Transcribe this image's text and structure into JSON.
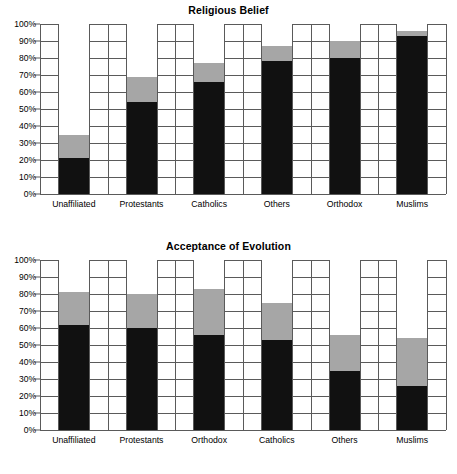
{
  "chart_data": [
    {
      "type": "bar",
      "subtype": "stacked-100",
      "title": "Religious Belief",
      "xlabel": "",
      "ylabel": "",
      "ylim": [
        0,
        100
      ],
      "ytick_labels": [
        "0%",
        "10%",
        "20%",
        "30%",
        "40%",
        "50%",
        "60%",
        "70%",
        "80%",
        "90%",
        "100%"
      ],
      "ytick_values": [
        0,
        10,
        20,
        30,
        40,
        50,
        60,
        70,
        80,
        90,
        100
      ],
      "grid": true,
      "legend": "none",
      "categories": [
        "Unaffiliated",
        "Protestants",
        "Catholics",
        "Others",
        "Orthodox",
        "Muslims"
      ],
      "series": [
        {
          "name": "black",
          "color": "#111111",
          "values": [
            21,
            54,
            66,
            78,
            80,
            93
          ]
        },
        {
          "name": "gray",
          "color": "#a6a6a6",
          "values": [
            14,
            15,
            11,
            9,
            10,
            3
          ]
        },
        {
          "name": "white",
          "color": "#ffffff",
          "values": [
            65,
            31,
            23,
            13,
            10,
            4
          ]
        }
      ],
      "cumulative_tops": {
        "black": [
          21,
          54,
          66,
          78,
          80,
          93
        ],
        "gray": [
          35,
          69,
          77,
          87,
          90,
          96
        ]
      }
    },
    {
      "type": "bar",
      "subtype": "stacked-100",
      "title": "Acceptance of Evolution",
      "xlabel": "",
      "ylabel": "",
      "ylim": [
        0,
        100
      ],
      "ytick_labels": [
        "0%",
        "10%",
        "20%",
        "30%",
        "40%",
        "50%",
        "60%",
        "70%",
        "80%",
        "90%",
        "100%"
      ],
      "ytick_values": [
        0,
        10,
        20,
        30,
        40,
        50,
        60,
        70,
        80,
        90,
        100
      ],
      "grid": true,
      "legend": "none",
      "categories": [
        "Unaffiliated",
        "Protestants",
        "Orthodox",
        "Catholics",
        "Others",
        "Muslims"
      ],
      "series": [
        {
          "name": "black",
          "color": "#111111",
          "values": [
            62,
            60,
            56,
            53,
            35,
            26
          ]
        },
        {
          "name": "gray",
          "color": "#a6a6a6",
          "values": [
            19,
            20,
            27,
            22,
            21,
            28
          ]
        },
        {
          "name": "white",
          "color": "#ffffff",
          "values": [
            19,
            20,
            17,
            25,
            44,
            46
          ]
        }
      ],
      "cumulative_tops": {
        "black": [
          62,
          60,
          56,
          53,
          35,
          26
        ],
        "gray": [
          81,
          80,
          83,
          75,
          56,
          54
        ]
      }
    }
  ],
  "colors": {
    "black_segment": "#111111",
    "gray_segment": "#a6a6a6",
    "white_segment": "#ffffff",
    "grid": "#5a5a5a",
    "text": "#000000",
    "background": "#ffffff"
  }
}
